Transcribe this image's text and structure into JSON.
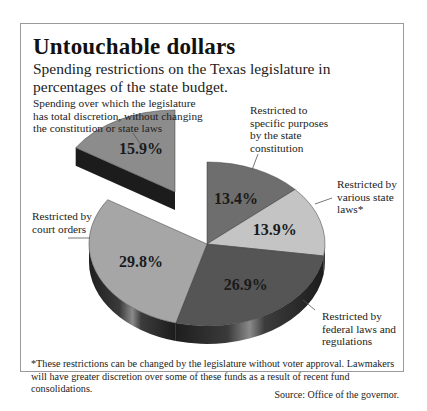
{
  "title": "Untouchable dollars",
  "subtitle": "Spending restrictions on the Texas legislature in percentages of the state budget.",
  "labels": {
    "discretion": "Spending over which the legislature has total discretion, without changing the constitution or state laws",
    "constitution": "Restricted to specific purposes by the state constitution",
    "state_laws": "Restricted by various state laws*",
    "federal": "Restricted by federal laws and regulations",
    "court": "Restricted by court orders"
  },
  "footnote": "*These restrictions can be changed by the legislature without voter approval.  Lawmakers will have greater discretion over some of these funds as a result of recent fund consolidations.",
  "source": "Source:  Office of the governor.",
  "chart_data": {
    "type": "pie",
    "title": "Untouchable dollars",
    "subtitle": "Spending restrictions on the Texas legislature in percentages of the state budget.",
    "categories": [
      "Restricted to specific purposes by the state constitution",
      "Restricted by various state laws*",
      "Restricted by federal laws and regulations",
      "Restricted by court orders",
      "Spending over which the legislature has total discretion, without changing the constitution or state laws"
    ],
    "values": [
      13.4,
      13.9,
      26.9,
      29.8,
      15.9
    ],
    "value_labels": [
      "13.4%",
      "13.9%",
      "26.9%",
      "29.8%",
      "15.9%"
    ],
    "colors": [
      "#6e6e6e",
      "#c4c4c4",
      "#555555",
      "#a6a6a6",
      "#8c8c8c"
    ],
    "exploded": [
      false,
      false,
      false,
      false,
      true
    ],
    "style": "3d",
    "legend": "callout labels",
    "footnote": "*These restrictions can be changed by the legislature without voter approval.  Lawmakers will have greater discretion over some of these funds as a result of recent fund consolidations.",
    "source": "Source:  Office of the governor."
  }
}
